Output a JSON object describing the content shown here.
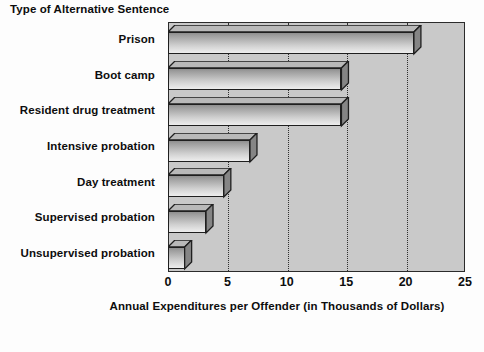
{
  "chart_data": {
    "type": "bar",
    "orientation": "horizontal",
    "title": "",
    "ylabel": "Type of Alternative Sentence",
    "xlabel": "Annual Expenditures per Offender (in Thousands of Dollars)",
    "categories": [
      "Prison",
      "Boot camp",
      "Resident drug treatment",
      "Intensive probation",
      "Day treatment",
      "Supervised probation",
      "Unsupervised probation"
    ],
    "values": [
      20.7,
      14.6,
      14.6,
      6.9,
      4.7,
      3.2,
      1.4
    ],
    "xlim": [
      0,
      25
    ],
    "xticks": [
      0,
      5,
      10,
      15,
      20,
      25
    ],
    "xtick_labels": [
      "0",
      "5",
      "10",
      "15",
      "20",
      "25"
    ],
    "grid": "vertical-dotted",
    "legend": "none",
    "style": "3d-shaded-bars",
    "colors": {
      "plot_background": "#c9c9c9",
      "figure_background": "#fdfdfd",
      "bar_face_light": "#ededed",
      "bar_face_dark": "#8e8e8e",
      "bar_outline": "#1f1f1f",
      "axis_border": "#2b2b2b",
      "text": "#0d0d0d",
      "gridline": "#2e2e2e"
    }
  }
}
